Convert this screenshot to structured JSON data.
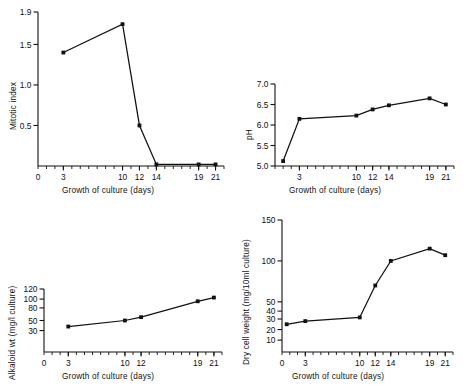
{
  "figure": {
    "background": "#ffffff",
    "ink": "#111111",
    "panel_count": 4
  },
  "common": {
    "xlabel": "Growth of culture  (days)",
    "x_ticks": [
      "0",
      "3",
      "10",
      "12",
      "14",
      "19",
      "21"
    ],
    "x_tick_values": [
      0,
      3,
      10,
      12,
      14,
      19,
      21
    ]
  },
  "chart_data": [
    {
      "id": "mitotic-index",
      "position": "top-left",
      "type": "line",
      "title": "",
      "xlabel": "Growth of culture  (days)",
      "ylabel": "Mitotic  index",
      "x": [
        3,
        10,
        12,
        14,
        19,
        21
      ],
      "values": [
        1.4,
        1.75,
        0.5,
        0.02,
        0.02,
        0.02
      ],
      "y_ticks": [
        "0.5",
        "1.0",
        "1.5",
        "1.9"
      ],
      "y_tick_values": [
        0.5,
        1.0,
        1.5,
        1.9
      ],
      "x_ticks": [
        "0",
        "3",
        "10",
        "12",
        "14",
        "19",
        "21"
      ],
      "xlim": [
        0,
        22
      ],
      "ylim": [
        0,
        1.9
      ],
      "grid": false,
      "legend": "none",
      "marker": "filled-square"
    },
    {
      "id": "ph",
      "position": "top-right",
      "type": "line",
      "title": "",
      "xlabel": "Growth of culture  (days)",
      "ylabel": "pH",
      "x": [
        1,
        3,
        10,
        12,
        14,
        19,
        21
      ],
      "values": [
        5.12,
        6.15,
        6.23,
        6.38,
        6.48,
        6.65,
        6.5
      ],
      "y_ticks": [
        "5.0",
        "5.5",
        "6.0",
        "6.5",
        "7.0"
      ],
      "y_tick_values": [
        5.0,
        5.5,
        6.0,
        6.5,
        7.0
      ],
      "x_ticks": [
        "3",
        "10",
        "12",
        "14",
        "19",
        "21"
      ],
      "xlim": [
        0,
        22
      ],
      "ylim": [
        5.0,
        7.0
      ],
      "grid": false,
      "legend": "none",
      "marker": "filled-square"
    },
    {
      "id": "alkaloid-weight",
      "position": "bottom-left",
      "type": "line",
      "title": "",
      "xlabel": "Growth of culture  (days)",
      "ylabel": "Alkaloid wt (mg/l culture)",
      "x": [
        3,
        10,
        12,
        19,
        21
      ],
      "values": [
        38,
        50,
        58,
        95,
        103
      ],
      "y_ticks": [
        "30",
        "50",
        "80",
        "100",
        "120"
      ],
      "y_tick_values": [
        30,
        50,
        80,
        100,
        120
      ],
      "x_ticks": [
        "0",
        "3",
        "10",
        "12",
        "19",
        "21"
      ],
      "xlim": [
        0,
        22
      ],
      "ylim": [
        0,
        120
      ],
      "y_scale": "compressed",
      "grid": false,
      "legend": "none",
      "marker": "filled-square"
    },
    {
      "id": "dry-cell-weight",
      "position": "bottom-right",
      "type": "line",
      "title": "",
      "xlabel": "Growth of culture  (days)",
      "ylabel": "Dry cell weight  (mg/10ml  culture)",
      "x": [
        0.6,
        3,
        10,
        12,
        14,
        19,
        21
      ],
      "values": [
        25,
        28,
        32,
        70,
        100,
        115,
        107
      ],
      "y_ticks": [
        "10",
        "20",
        "30",
        "40",
        "50",
        "100",
        "150"
      ],
      "y_tick_values": [
        10,
        20,
        30,
        40,
        50,
        100,
        150
      ],
      "x_ticks": [
        "0",
        "3",
        "10",
        "12",
        "14",
        "19",
        "21"
      ],
      "xlim": [
        0,
        22
      ],
      "ylim": [
        0,
        150
      ],
      "y_scale": "compressed",
      "grid": false,
      "legend": "none",
      "marker": "filled-square"
    }
  ]
}
